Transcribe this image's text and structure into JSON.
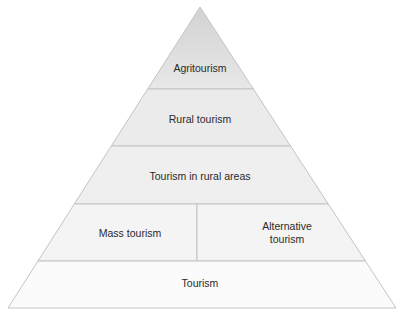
{
  "diagram": {
    "type": "pyramid",
    "layers": [
      {
        "label": "Agritourism",
        "level": 1
      },
      {
        "label": "Rural tourism",
        "level": 2
      },
      {
        "label": "Tourism in rural areas",
        "level": 3
      },
      {
        "label": "Mass tourism",
        "level": 4,
        "position": "left"
      },
      {
        "label": "Alternative tourism",
        "label_lines": [
          "Alternative",
          "tourism"
        ],
        "level": 4,
        "position": "right"
      },
      {
        "label": "Tourism",
        "level": 5
      }
    ],
    "colors": {
      "top_fill": "#e6e6e6",
      "upper_fill": "#ececec",
      "middle_fill": "#f2f2f2",
      "base_fill": "#fbfbfb",
      "stroke": "#c4c4c4"
    }
  }
}
